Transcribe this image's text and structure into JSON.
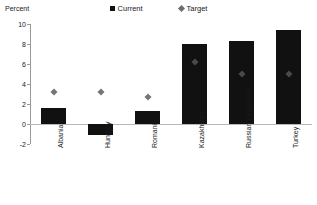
{
  "axis_title": "Percent",
  "legend": [
    {
      "label": "Current",
      "marker": "square-icon",
      "color": "#111111"
    },
    {
      "label": "Target",
      "marker": "diamond-icon",
      "color": "#6e6e6e"
    }
  ],
  "y_ticks": [
    "10",
    "8",
    "6",
    "4",
    "2",
    "0",
    "-2"
  ],
  "categories": [
    "Albania",
    "Hungary",
    "Romania",
    "Kazakhstan",
    "Russian Federation",
    "Turkey"
  ],
  "chart_data": {
    "type": "bar",
    "title": "",
    "subtitle": "",
    "xlabel": "",
    "ylabel": "Percent",
    "ylim": [
      -2,
      10
    ],
    "ytick_step": 2,
    "grid": false,
    "legend_position": "top-center",
    "categories": [
      "Albania",
      "Hungary",
      "Romania",
      "Kazakhstan",
      "Russian Federation",
      "Turkey"
    ],
    "series": [
      {
        "name": "Current",
        "type": "bar",
        "color": "#111111",
        "values": [
          1.6,
          -1.1,
          1.3,
          8.0,
          8.3,
          9.4
        ]
      },
      {
        "name": "Target",
        "type": "scatter",
        "marker": "diamond",
        "color": "#6e6e6e",
        "values": [
          3.2,
          3.2,
          2.7,
          6.2,
          5.0,
          5.0
        ]
      }
    ]
  }
}
